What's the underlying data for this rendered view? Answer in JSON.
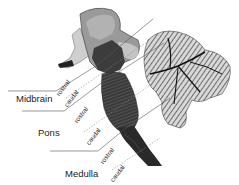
{
  "diagram": {
    "regions": [
      {
        "label": "Midbrain",
        "rostral": "rostral",
        "caudal": "caudal"
      },
      {
        "label": "Pons",
        "rostral": "rostral",
        "caudal": "caudal"
      },
      {
        "label": "Medulla",
        "rostral": "rostral",
        "caudal": "caudal"
      }
    ],
    "colors": {
      "line": "#555555",
      "dashed": "#888888",
      "tissue_dark": "#2a2a2a",
      "tissue_mid": "#6a6a6a",
      "tissue_light": "#b5b5b5"
    }
  }
}
